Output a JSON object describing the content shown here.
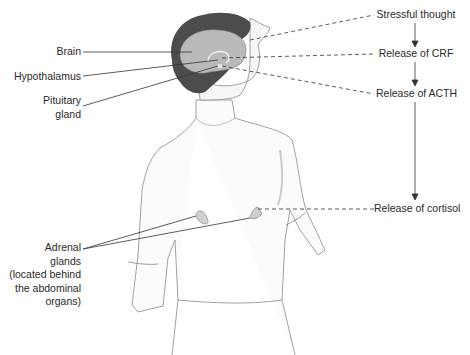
{
  "diagram": {
    "left_labels": {
      "brain": "Brain",
      "hypothalamus": "Hypothalamus",
      "pituitary_line1": "Pituitary",
      "pituitary_line2": "gland",
      "adrenal_line1": "Adrenal",
      "adrenal_line2": "glands",
      "adrenal_line3": "(located behind",
      "adrenal_line4": "the abdominal",
      "adrenal_line5": "organs)"
    },
    "flow_steps": [
      "Stressful thought",
      "Release of CRF",
      "Release of ACTH",
      "Release of cortisol"
    ],
    "colors": {
      "line": "#333333",
      "hair": "#4a4a4a",
      "brain": "#b8b8b8",
      "skin_outline": "#888888"
    }
  }
}
